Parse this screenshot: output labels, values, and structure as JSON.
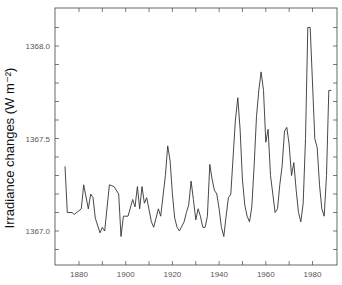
{
  "chart_data": {
    "type": "line",
    "title": "",
    "xlabel": "",
    "ylabel": "Irradiance changes (W m⁻²)",
    "xlim": [
      1870,
      1990
    ],
    "ylim": [
      1366.85,
      1368.2
    ],
    "xticks": [
      1880,
      1900,
      1920,
      1940,
      1960,
      1980
    ],
    "yticks": [
      1367.0,
      1367.5,
      1368.0
    ],
    "ytick_labels": [
      "1367.0",
      "1367.5",
      "1368.0"
    ],
    "grid": false,
    "legend": null,
    "series": [
      {
        "name": "Irradiance",
        "color": "#333333",
        "x": [
          1874,
          1875,
          1877,
          1878,
          1881,
          1882,
          1884,
          1885,
          1886,
          1887,
          1889,
          1890,
          1891,
          1893,
          1895,
          1897,
          1898,
          1899,
          1901,
          1903,
          1904,
          1905,
          1906,
          1907,
          1908,
          1909,
          1911,
          1912,
          1914,
          1915,
          1917,
          1918,
          1919,
          1920,
          1921,
          1922,
          1923,
          1925,
          1926,
          1927,
          1928,
          1929,
          1930,
          1931,
          1932,
          1933,
          1934,
          1935,
          1936,
          1937,
          1938,
          1939,
          1940,
          1941,
          1942,
          1943,
          1944,
          1945,
          1946,
          1947,
          1948,
          1949,
          1950,
          1951,
          1952,
          1953,
          1954,
          1955,
          1956,
          1957,
          1958,
          1959,
          1960,
          1961,
          1962,
          1963,
          1964,
          1965,
          1966,
          1967,
          1968,
          1969,
          1970,
          1971,
          1972,
          1973,
          1974,
          1975,
          1976,
          1977,
          1978,
          1979,
          1980,
          1981,
          1982,
          1983,
          1984,
          1985,
          1986,
          1987,
          1988
        ],
        "values": [
          1367.35,
          1367.1,
          1367.1,
          1367.09,
          1367.12,
          1367.25,
          1367.12,
          1367.2,
          1367.18,
          1367.07,
          1366.99,
          1367.02,
          1367.0,
          1367.25,
          1367.24,
          1367.2,
          1366.97,
          1367.08,
          1367.08,
          1367.17,
          1367.13,
          1367.24,
          1367.12,
          1367.24,
          1367.15,
          1367.18,
          1367.05,
          1367.02,
          1367.12,
          1367.08,
          1367.3,
          1367.46,
          1367.38,
          1367.2,
          1367.07,
          1367.02,
          1367.0,
          1367.05,
          1367.1,
          1367.14,
          1367.27,
          1367.17,
          1367.06,
          1367.12,
          1367.08,
          1367.02,
          1367.02,
          1367.08,
          1367.36,
          1367.28,
          1367.22,
          1367.2,
          1367.12,
          1367.02,
          1366.97,
          1367.08,
          1367.18,
          1367.2,
          1367.4,
          1367.6,
          1367.72,
          1367.55,
          1367.28,
          1367.14,
          1367.08,
          1367.05,
          1367.13,
          1367.35,
          1367.62,
          1367.76,
          1367.86,
          1367.76,
          1367.48,
          1367.55,
          1367.3,
          1367.2,
          1367.1,
          1367.12,
          1367.25,
          1367.35,
          1367.54,
          1367.56,
          1367.47,
          1367.3,
          1367.37,
          1367.22,
          1367.1,
          1367.05,
          1367.15,
          1367.5,
          1368.1,
          1368.1,
          1367.8,
          1367.5,
          1367.45,
          1367.25,
          1367.12,
          1367.08,
          1367.3,
          1367.76,
          1367.76
        ]
      }
    ]
  }
}
